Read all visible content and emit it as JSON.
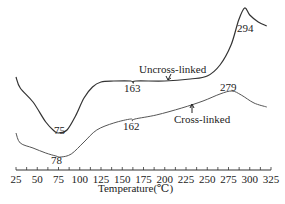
{
  "chart_data": {
    "type": "line",
    "title": "",
    "xlabel": "Temperature(℃)",
    "ylabel": "",
    "xlim": [
      25,
      325
    ],
    "x_ticks": [
      "25",
      "50",
      "75",
      "100",
      "125",
      "150",
      "175",
      "200",
      "225",
      "250",
      "275",
      "300",
      "325"
    ],
    "grid": false,
    "legend": "inline annotations",
    "series": [
      {
        "name": "Uncross-linked",
        "annotations": [
          {
            "x": 75,
            "label": "75",
            "kind": "endothermic minimum"
          },
          {
            "x": 163,
            "label": "163",
            "kind": "small step"
          },
          {
            "x": 294,
            "label": "294",
            "kind": "exothermic peak"
          }
        ],
        "points": [
          [
            25,
            77
          ],
          [
            30,
            88
          ],
          [
            45,
            102
          ],
          [
            60,
            122
          ],
          [
            70,
            131
          ],
          [
            75,
            133
          ],
          [
            85,
            130
          ],
          [
            95,
            116
          ],
          [
            105,
            98
          ],
          [
            115,
            87
          ],
          [
            125,
            82
          ],
          [
            140,
            81
          ],
          [
            160,
            81
          ],
          [
            163,
            83
          ],
          [
            166,
            81
          ],
          [
            200,
            81
          ],
          [
            230,
            79
          ],
          [
            250,
            76
          ],
          [
            265,
            65
          ],
          [
            278,
            45
          ],
          [
            287,
            20
          ],
          [
            294,
            8
          ],
          [
            300,
            15
          ],
          [
            310,
            22
          ],
          [
            320,
            26
          ]
        ]
      },
      {
        "name": "Cross-linked",
        "annotations": [
          {
            "x": 78,
            "label": "78",
            "kind": "endothermic minimum"
          },
          {
            "x": 162,
            "label": "162",
            "kind": "small step"
          },
          {
            "x": 279,
            "label": "279",
            "kind": "exothermic peak"
          }
        ],
        "points": [
          [
            25,
            133
          ],
          [
            30,
            143
          ],
          [
            45,
            148
          ],
          [
            60,
            153
          ],
          [
            72,
            156
          ],
          [
            78,
            157
          ],
          [
            90,
            154
          ],
          [
            105,
            142
          ],
          [
            120,
            130
          ],
          [
            140,
            123
          ],
          [
            160,
            119
          ],
          [
            162,
            121
          ],
          [
            165,
            119
          ],
          [
            190,
            115
          ],
          [
            220,
            108
          ],
          [
            245,
            101
          ],
          [
            265,
            94
          ],
          [
            279,
            91
          ],
          [
            290,
            95
          ],
          [
            305,
            103
          ],
          [
            320,
            107
          ]
        ]
      }
    ],
    "y_units": "pixel-relative heat flow (no y-axis shown)"
  },
  "labels": {
    "uncross": "Uncross-linked",
    "cross": "Cross-linked",
    "p75": "75",
    "p163": "163",
    "p294": "294",
    "p78": "78",
    "p162": "162",
    "p279": "279",
    "xlabel": "Temperature(℃)"
  }
}
